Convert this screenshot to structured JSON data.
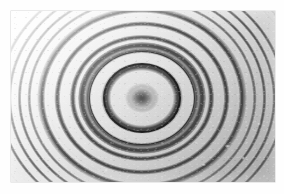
{
  "figure": {
    "domain_kind": "natural-image",
    "medium": "black-and-white photographic print",
    "orientation": "landscape",
    "visible_text": "",
    "caption": ""
  },
  "page": {
    "background_color": "#ffffff",
    "margin_left_px": 11,
    "margin_top_px": 11,
    "margin_right_px": 9,
    "margin_bottom_px": 12
  },
  "plate": {
    "name": "photographic-plate",
    "x_px": 11,
    "y_px": 11,
    "width_px": 264,
    "height_px": 171,
    "border_style": "soft edge, no printed frame line",
    "base_tone_light": "#fbfbfb",
    "base_tone_mid": "#e2e2e2",
    "base_tone_dark": "#bdbdbd",
    "fringe_ink_color": "#232323",
    "highlight_color": "#ffffff"
  },
  "pattern": {
    "type": "concentric-rings",
    "center_x_px": 142,
    "center_y_px": 98,
    "center_x_fraction": 0.5,
    "center_y_fraction": 0.5,
    "ellipticity_x_over_y": 1.14,
    "core_spot": {
      "label": "diffuse dark central spot",
      "radius_px": 9,
      "darkness": "very dark, soft-edged"
    },
    "halo": {
      "label": "bright halo around centre",
      "inner_radius_px": 10,
      "outer_radius_px": 24
    },
    "dominant_ring": {
      "label": "heavy dark ring",
      "radius_px": 28,
      "stroke_px": 2.6
    },
    "second_strong_ring": {
      "label": "secondary heavy ring",
      "radius_px": 40,
      "stroke_px": 1.9
    },
    "approx_visible_ring_count": 32,
    "radius_law": "r proportional to sqrt(n)",
    "ring_spacing_inner_px": 12,
    "ring_spacing_mid_px": 7,
    "ring_spacing_outer_px": 3,
    "contrast_profile": "highest at mid radii; fades toward the upper-left corner; greyer cast with fine fringes at the lower-right corner"
  },
  "defects": {
    "grain": "fine photographic emulsion grain across the whole plate",
    "blemishes": "small light specks concentrated in the lower-right quadrant"
  },
  "icons": {
    "plate_icon": "photograph-icon",
    "center_icon": "target-center-icon"
  }
}
